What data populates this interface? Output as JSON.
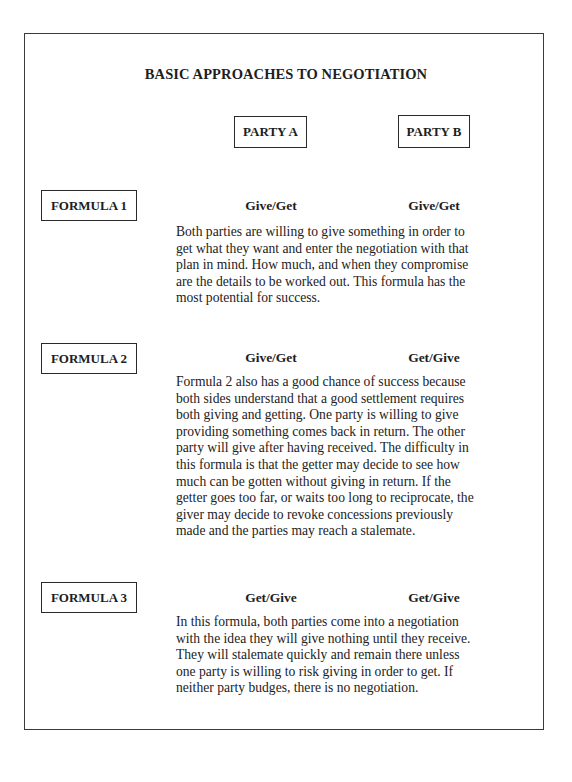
{
  "document": {
    "title": "BASIC APPROACHES TO NEGOTIATION",
    "parties": {
      "a": "PARTY A",
      "b": "PARTY B"
    },
    "formulas": [
      {
        "label": "FORMULA 1",
        "party_a": "Give/Get",
        "party_b": "Give/Get",
        "description": "Both parties are willing to give something in order to\nget what they want and enter the negotiation with that\nplan in mind. How much, and when they compromise\nare the details to be worked out. This formula has the\nmost potential for success."
      },
      {
        "label": "FORMULA 2",
        "party_a": "Give/Get",
        "party_b": "Get/Give",
        "description": "Formula 2 also has a good chance of success because\nboth sides understand that a good settlement requires\nboth giving and getting. One party is willing to give\nproviding something comes back in return. The other\nparty will give after having received. The difficulty in\nthis formula is that the getter may decide to see how\nmuch can be gotten without giving in return. If the\ngetter goes too far, or waits too long to reciprocate, the\ngiver may decide to revoke concessions previously\nmade and the parties may reach a stalemate."
      },
      {
        "label": "FORMULA 3",
        "party_a": "Get/Give",
        "party_b": "Get/Give",
        "description": "In this formula, both parties come into a negotiation\nwith the idea they will give nothing until they receive.\nThey will stalemate quickly and remain there unless\none party is willing to risk giving in order to get. If\nneither party budges, there is no negotiation."
      }
    ]
  }
}
